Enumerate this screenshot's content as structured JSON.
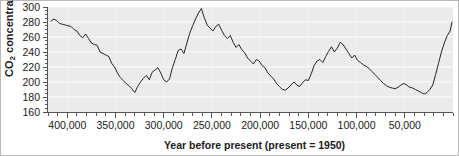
{
  "chart_data": {
    "type": "line",
    "title": "",
    "xlabel": "Year before present (present = 1950)",
    "ylabel_html": "CO2 concentration, ppmv",
    "ylabel_main": "CO",
    "ylabel_sub": "2",
    "ylabel_rest": " concentration, ppmv",
    "xlim": [
      420000,
      0
    ],
    "ylim": [
      160,
      300
    ],
    "x_reversed": true,
    "grid": "horizontal-light",
    "legend": "none",
    "y_ticks": [
      160,
      180,
      200,
      220,
      240,
      260,
      280,
      300
    ],
    "y_tick_labels": [
      "160",
      "180",
      "200",
      "220",
      "240",
      "260",
      "280",
      "300"
    ],
    "y_minor_tick_step": 5,
    "x_ticks": [
      400000,
      350000,
      300000,
      250000,
      200000,
      150000,
      100000,
      50000
    ],
    "x_tick_labels": [
      "400,000",
      "350,000",
      "300,000",
      "250,000",
      "200,000",
      "150,000",
      "100,000",
      "50,000"
    ],
    "x_minor_tick_step": 10000,
    "line_color": "#262626",
    "plot_background": "#ebebeb",
    "gridline_color": "#f7f7f7",
    "axis_color": "#555555",
    "series": [
      {
        "name": "CO2 concentration",
        "x": [
          417000,
          414000,
          411000,
          408000,
          405000,
          402000,
          399000,
          396000,
          393000,
          390000,
          387000,
          384000,
          381000,
          378000,
          375000,
          372000,
          369000,
          366000,
          363000,
          360000,
          357000,
          354000,
          351000,
          348000,
          345000,
          342000,
          339000,
          336000,
          333000,
          330000,
          327000,
          324000,
          321000,
          318000,
          315000,
          312000,
          309000,
          306000,
          303000,
          300000,
          297000,
          294000,
          291000,
          288000,
          285000,
          282000,
          279000,
          276000,
          273000,
          270000,
          267000,
          264000,
          261000,
          258000,
          255000,
          252000,
          249000,
          246000,
          243000,
          240000,
          237000,
          234000,
          231000,
          228000,
          225000,
          222000,
          219000,
          216000,
          213000,
          210000,
          207000,
          204000,
          201000,
          198000,
          195000,
          192000,
          189000,
          186000,
          183000,
          180000,
          177000,
          174000,
          171000,
          168000,
          165000,
          162000,
          159000,
          156000,
          153000,
          150000,
          147000,
          144000,
          141000,
          138000,
          135000,
          132000,
          129000,
          126000,
          123000,
          120000,
          117000,
          114000,
          111000,
          108000,
          105000,
          102000,
          99000,
          96000,
          93000,
          90000,
          87000,
          84000,
          81000,
          78000,
          75000,
          72000,
          69000,
          66000,
          63000,
          60000,
          57000,
          54000,
          51000,
          48000,
          45000,
          42000,
          39000,
          36000,
          33000,
          30000,
          27000,
          24000,
          21000,
          18000,
          15000,
          12000,
          9000,
          6000,
          3000,
          1000
        ],
        "values": [
          281,
          284,
          282,
          278,
          277,
          276,
          275,
          274,
          270,
          268,
          262,
          259,
          264,
          258,
          252,
          250,
          249,
          240,
          238,
          236,
          234,
          225,
          220,
          212,
          206,
          202,
          198,
          195,
          191,
          186,
          194,
          200,
          205,
          209,
          203,
          213,
          216,
          219,
          212,
          203,
          200,
          204,
          219,
          230,
          242,
          244,
          238,
          252,
          265,
          275,
          284,
          292,
          298,
          286,
          276,
          272,
          268,
          274,
          277,
          269,
          262,
          258,
          262,
          253,
          246,
          250,
          243,
          239,
          232,
          228,
          224,
          230,
          228,
          222,
          219,
          212,
          208,
          204,
          198,
          194,
          190,
          189,
          192,
          196,
          200,
          196,
          194,
          199,
          203,
          202,
          211,
          222,
          228,
          230,
          226,
          234,
          241,
          247,
          240,
          245,
          253,
          250,
          244,
          238,
          232,
          236,
          229,
          226,
          223,
          221,
          218,
          214,
          210,
          206,
          202,
          198,
          195,
          193,
          192,
          191,
          193,
          196,
          198,
          196,
          193,
          192,
          190,
          188,
          186,
          184,
          186,
          190,
          196,
          210,
          225,
          240,
          252,
          262,
          268,
          280
        ]
      }
    ]
  }
}
